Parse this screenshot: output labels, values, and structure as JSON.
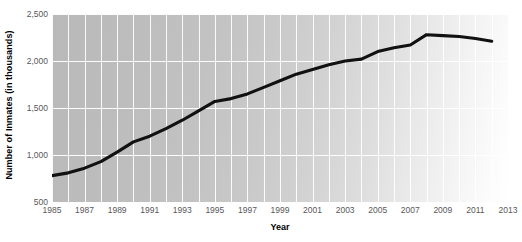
{
  "chart_data": {
    "type": "line",
    "title": "",
    "xlabel": "Year",
    "ylabel": "Number of Inmates (in thousands)",
    "xlim": [
      1985,
      2013
    ],
    "ylim": [
      500,
      2500
    ],
    "ytick_labels": [
      "2,500",
      "2,000",
      "1,500",
      "1,000",
      "500"
    ],
    "ytick_values": [
      2500,
      2000,
      1500,
      1000,
      500
    ],
    "xtick_labels": [
      "1985",
      "1987",
      "1989",
      "1991",
      "1993",
      "1995",
      "1997",
      "1999",
      "2001",
      "2003",
      "2005",
      "2007",
      "2009",
      "2011",
      "2013"
    ],
    "xtick_values": [
      1985,
      1987,
      1989,
      1991,
      1993,
      1995,
      1997,
      1999,
      2001,
      2003,
      2005,
      2007,
      2009,
      2011,
      2013
    ],
    "grid": "both",
    "legend": "none",
    "series": [
      {
        "name": "Number of Inmates",
        "color": "#111111",
        "x": [
          1985,
          1986,
          1987,
          1988,
          1989,
          1990,
          1991,
          1992,
          1993,
          1994,
          1995,
          1996,
          1997,
          1998,
          1999,
          2000,
          2001,
          2002,
          2003,
          2004,
          2005,
          2006,
          2007,
          2008,
          2009,
          2010,
          2011,
          2012
        ],
        "values": [
          780,
          810,
          860,
          930,
          1030,
          1140,
          1200,
          1280,
          1370,
          1470,
          1570,
          1600,
          1650,
          1720,
          1790,
          1860,
          1910,
          1960,
          2000,
          2020,
          2100,
          2140,
          2170,
          2280,
          2270,
          2260,
          2240,
          2210
        ]
      }
    ]
  }
}
